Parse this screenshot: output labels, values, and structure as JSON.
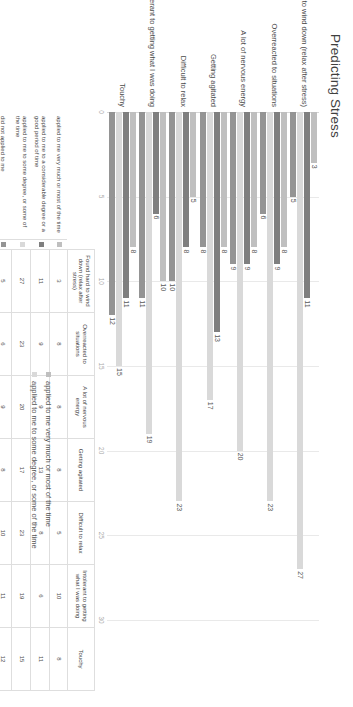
{
  "chart_data": {
    "type": "bar",
    "title": "Predicting Stress",
    "xlabel": "",
    "ylabel": "",
    "orientation": "horizontal",
    "xlim": [
      0,
      30
    ],
    "xticks": [
      0,
      5,
      10,
      15,
      20,
      25,
      30
    ],
    "grid": true,
    "legend_position": "bottom",
    "categories": [
      "Found hard to wind down (relax after stress)",
      "Overreacted to situations",
      "A lot of nervous energy",
      "Getting agitated",
      "Difficult to relax",
      "Intolerant to getting what I was doing",
      "Touchy"
    ],
    "series": [
      {
        "name": "applied to me very much or most of the time",
        "color": "#bfbfbf",
        "values": [
          3,
          8,
          8,
          8,
          5,
          10,
          8
        ]
      },
      {
        "name": "applied to me to a considerable degree or a good period of time",
        "color": "#7f7f7f",
        "values": [
          11,
          9,
          9,
          13,
          8,
          6,
          11
        ]
      },
      {
        "name": "applied to me to some degree, or some of the time",
        "color": "#d9d9d9",
        "values": [
          27,
          23,
          20,
          17,
          23,
          19,
          15
        ]
      },
      {
        "name": "did not applied to me",
        "color": "#949494",
        "values": [
          5,
          6,
          9,
          8,
          10,
          11,
          12
        ]
      }
    ]
  },
  "table": {
    "columns": [
      "Found hard to wind down (relax after stress)",
      "Overreacted to situations",
      "A lot of nervous energy",
      "Getting agitated",
      "Difficult to relax",
      "Intolerant to getting what I was doing",
      "Touchy"
    ],
    "rows": [
      {
        "label": "applied to me very much or most of the time",
        "color": "#bfbfbf",
        "values": [
          3,
          8,
          8,
          8,
          5,
          10,
          8
        ]
      },
      {
        "label": "applied to me to a considerable degree or a good period of time",
        "color": "#7f7f7f",
        "values": [
          11,
          9,
          9,
          13,
          8,
          6,
          11
        ]
      },
      {
        "label": "applied to me to some degree, or some of the time",
        "color": "#d9d9d9",
        "values": [
          27,
          23,
          20,
          17,
          23,
          19,
          15
        ]
      },
      {
        "label": "did not applied to me",
        "color": "#949494",
        "values": [
          5,
          6,
          9,
          8,
          10,
          11,
          12
        ]
      }
    ]
  },
  "legend": {
    "items": [
      {
        "label": "applied to me very much or most of the time",
        "color": "#bfbfbf"
      },
      {
        "label": "applied to me to some degree, or some of the time",
        "color": "#d9d9d9"
      }
    ]
  }
}
